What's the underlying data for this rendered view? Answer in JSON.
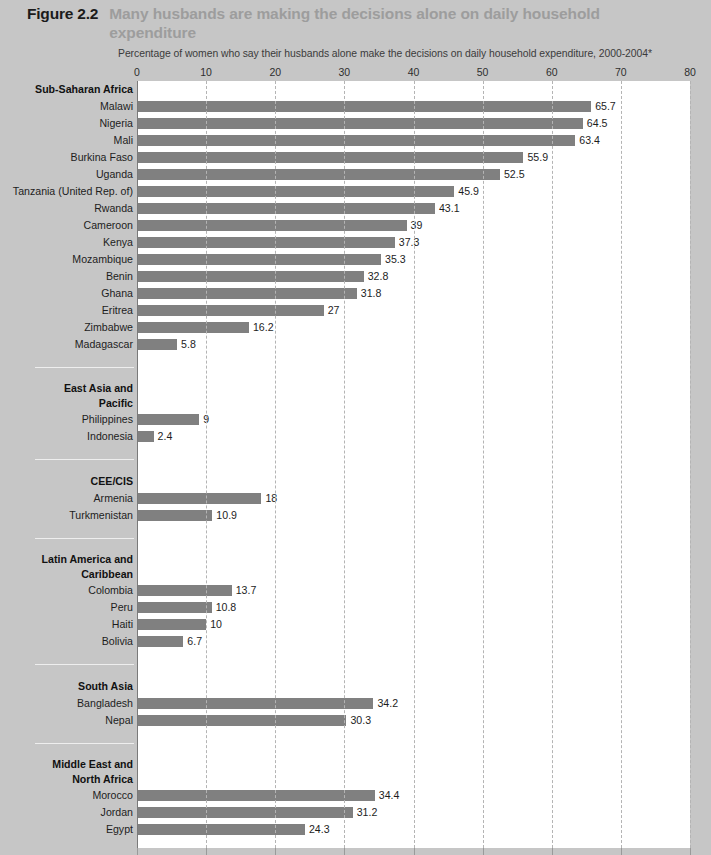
{
  "figure": {
    "number": "Figure 2.2",
    "title": "Many husbands are making the decisions alone on daily household expenditure",
    "subtitle": "Percentage of women who say their husbands alone make the decisions on daily household expenditure, 2000-2004*"
  },
  "colors": {
    "page_background": "#c6c6c6",
    "plot_background": "#ffffff",
    "bar": "#808080",
    "title_accent": "#9d9d9d",
    "figure_number": "#1b1b1b",
    "gridline": "#b4b4b4",
    "axis": "#7a7a7a",
    "separator": "#eeeeee"
  },
  "chart_data": {
    "type": "bar",
    "orientation": "horizontal",
    "title": "Many husbands are making the decisions alone on daily household expenditure",
    "subtitle": "Percentage of women who say their husbands alone make the decisions on daily household expenditure, 2000-2004*",
    "xlabel": "",
    "ylabel": "",
    "xlim": [
      0,
      80
    ],
    "xticks": [
      0,
      10,
      20,
      30,
      40,
      50,
      60,
      70,
      80
    ],
    "xtick_labels": [
      "0",
      "10",
      "20",
      "30",
      "40",
      "50",
      "60",
      "70",
      "80"
    ],
    "grid": true,
    "legend": false,
    "categories": [
      "Malawi",
      "Nigeria",
      "Mali",
      "Burkina Faso",
      "Uganda",
      "Tanzania (United Rep. of)",
      "Rwanda",
      "Cameroon",
      "Kenya",
      "Mozambique",
      "Benin",
      "Ghana",
      "Eritrea",
      "Zimbabwe",
      "Madagascar",
      "Philippines",
      "Indonesia",
      "Armenia",
      "Turkmenistan",
      "Colombia",
      "Peru",
      "Haiti",
      "Bolivia",
      "Bangladesh",
      "Nepal",
      "Morocco",
      "Jordan",
      "Egypt"
    ],
    "values": [
      65.7,
      64.5,
      63.4,
      55.9,
      52.5,
      45.9,
      43.1,
      39,
      37.3,
      35.3,
      32.8,
      31.8,
      27,
      16.2,
      5.8,
      9,
      2.4,
      18,
      10.9,
      13.7,
      10.8,
      10,
      6.7,
      34.2,
      30.3,
      34.4,
      31.2,
      24.3
    ],
    "groups": [
      {
        "name": "Sub-Saharan Africa",
        "name_lines": [
          "Sub-Saharan Africa"
        ],
        "categories": [
          "Malawi",
          "Nigeria",
          "Mali",
          "Burkina Faso",
          "Uganda",
          "Tanzania (United Rep. of)",
          "Rwanda",
          "Cameroon",
          "Kenya",
          "Mozambique",
          "Benin",
          "Ghana",
          "Eritrea",
          "Zimbabwe",
          "Madagascar"
        ],
        "values": [
          65.7,
          64.5,
          63.4,
          55.9,
          52.5,
          45.9,
          43.1,
          39,
          37.3,
          35.3,
          32.8,
          31.8,
          27,
          16.2,
          5.8
        ]
      },
      {
        "name": "East Asia and Pacific",
        "name_lines": [
          "East Asia and",
          "Pacific"
        ],
        "categories": [
          "Philippines",
          "Indonesia"
        ],
        "values": [
          9,
          2.4
        ]
      },
      {
        "name": "CEE/CIS",
        "name_lines": [
          "CEE/CIS"
        ],
        "categories": [
          "Armenia",
          "Turkmenistan"
        ],
        "values": [
          18,
          10.9
        ]
      },
      {
        "name": "Latin America and Caribbean",
        "name_lines": [
          "Latin America and",
          "Caribbean"
        ],
        "categories": [
          "Colombia",
          "Peru",
          "Haiti",
          "Bolivia"
        ],
        "values": [
          13.7,
          10.8,
          10,
          6.7
        ]
      },
      {
        "name": "South Asia",
        "name_lines": [
          "South Asia"
        ],
        "categories": [
          "Bangladesh",
          "Nepal"
        ],
        "values": [
          34.2,
          30.3
        ]
      },
      {
        "name": "Middle East and North Africa",
        "name_lines": [
          "Middle East and",
          "North Africa"
        ],
        "categories": [
          "Morocco",
          "Jordan",
          "Egypt"
        ],
        "values": [
          34.4,
          31.2,
          24.3
        ]
      }
    ],
    "value_labels": [
      "65.7",
      "64.5",
      "63.4",
      "55.9",
      "52.5",
      "45.9",
      "43.1",
      "39",
      "37.3",
      "35.3",
      "32.8",
      "31.8",
      "27",
      "16.2",
      "5.8",
      "9",
      "2.4",
      "18",
      "10.9",
      "13.7",
      "10.8",
      "10",
      "6.7",
      "34.2",
      "30.3",
      "34.4",
      "31.2",
      "24.3"
    ]
  }
}
